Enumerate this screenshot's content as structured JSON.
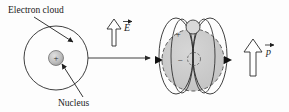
{
  "figure": {
    "background_color": "#fdfdfd",
    "stroke_color": "#2a2a2a",
    "cloud_fill_color": "#c9c9c9",
    "nucleus_fill_color": "#b8b8b8"
  },
  "labels": {
    "electron_cloud": "Electron cloud",
    "nucleus": "Nucleus"
  },
  "vectors": {
    "e_field": {
      "name": "E",
      "direction": "up",
      "style": "hollow-block-arrow"
    },
    "dipole_moment": {
      "name": "p",
      "direction": "up",
      "style": "hollow-block-arrow"
    },
    "transition": {
      "name": "transition-arrow",
      "direction": "right",
      "style": "thin-line-arrow"
    }
  },
  "left_atom": {
    "name": "unpolarized-atom",
    "charge_symbol": "+"
  },
  "right_atom": {
    "name": "polarized-atom",
    "positive_symbol": "+",
    "negative_symbol": "−"
  }
}
